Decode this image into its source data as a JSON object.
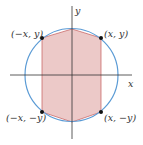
{
  "diagram": {
    "type": "inscribed-hexagon-in-circle",
    "axes": {
      "x_label": "x",
      "y_label": "y"
    },
    "points": [
      {
        "id": "top-left",
        "label": "(−x, y)"
      },
      {
        "id": "top-right",
        "label": "(x, y)"
      },
      {
        "id": "bottom-left",
        "label": "(−x, −y)"
      },
      {
        "id": "bottom-right",
        "label": "(x, −y)"
      }
    ],
    "colors": {
      "circle": "#5b9bd5",
      "polygon_fill": "#ecc9c8",
      "polygon_stroke": "#c45a5a",
      "axes": "#333333",
      "points": "#111111"
    }
  }
}
